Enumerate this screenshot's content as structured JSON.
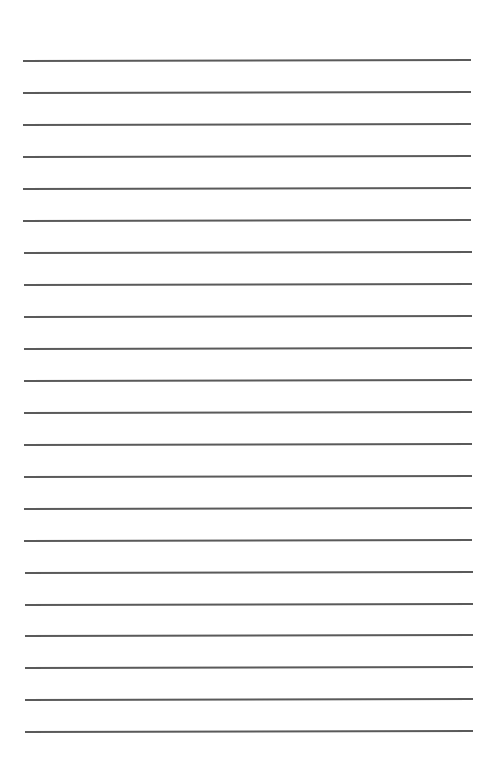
{
  "page": {
    "type": "lined-paper",
    "background": "#ffffff",
    "rule_color": "#5a5a5a",
    "rule_count": 22,
    "first_rule_y": 60,
    "rule_spacing": 31.9,
    "rule_left": 23,
    "rule_right": 471,
    "text": []
  }
}
